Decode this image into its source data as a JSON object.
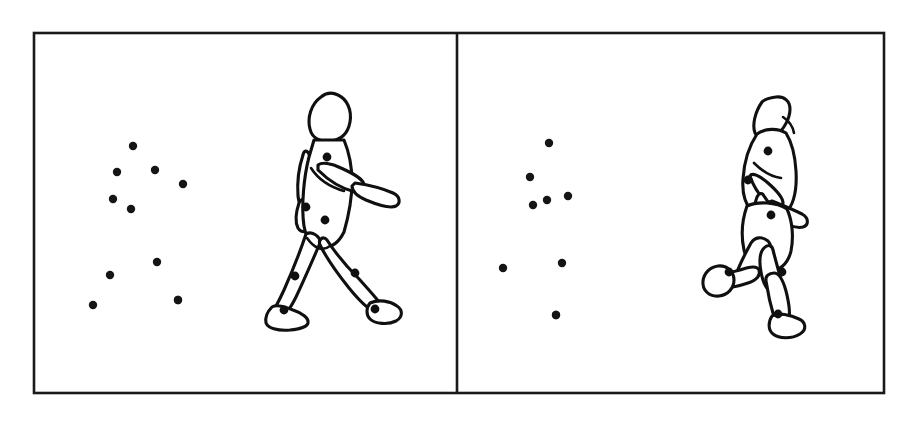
{
  "figure": {
    "background_color": "#ffffff",
    "ink_color": "#101010",
    "dot_color": "#151515",
    "border_color": "#1a1a1a",
    "border_width": 2.6,
    "outer_frame": {
      "x": 34,
      "y": 33,
      "width": 850,
      "height": 360
    },
    "divider_x": 457
  },
  "panels": [
    {
      "id": "panel-left",
      "label": "walking",
      "frame": {
        "x": 34,
        "y": 33,
        "width": 423,
        "height": 360
      },
      "point_light_display": {
        "label": "point-light walker",
        "dot_radius": 4.2,
        "count": 11,
        "dots": [
          {
            "name": "dot-head",
            "x": 133,
            "y": 146
          },
          {
            "name": "dot-shoulder-left",
            "x": 117,
            "y": 172
          },
          {
            "name": "dot-shoulder-right",
            "x": 155,
            "y": 170
          },
          {
            "name": "dot-elbow-right",
            "x": 183,
            "y": 184
          },
          {
            "name": "dot-elbow-left",
            "x": 113,
            "y": 199
          },
          {
            "name": "dot-wrist-left",
            "x": 131,
            "y": 209
          },
          {
            "name": "dot-hip-right",
            "x": 157,
            "y": 262
          },
          {
            "name": "dot-hip-left",
            "x": 110,
            "y": 275
          },
          {
            "name": "dot-knee-right",
            "x": 178,
            "y": 300
          },
          {
            "name": "dot-knee-left",
            "x": 93,
            "y": 305
          },
          {
            "name": "dot-ankle",
            "x": 178,
            "y": 300
          }
        ]
      },
      "body_figure": {
        "label": "walking figure",
        "pose": "mid-stride walk, facing right, right arm extended forward",
        "joint_markers": [
          {
            "name": "joint-shoulder",
            "x": 327,
            "y": 157,
            "r": 4.4
          },
          {
            "name": "joint-elbow",
            "x": 306,
            "y": 207,
            "r": 4.4
          },
          {
            "name": "joint-hip",
            "x": 325,
            "y": 220,
            "r": 4.4
          },
          {
            "name": "joint-knee-back",
            "x": 295,
            "y": 276,
            "r": 4.4
          },
          {
            "name": "joint-knee-front",
            "x": 355,
            "y": 273,
            "r": 4.4
          },
          {
            "name": "joint-ankle-back",
            "x": 284,
            "y": 310,
            "r": 4.4
          },
          {
            "name": "joint-ankle-front",
            "x": 375,
            "y": 309,
            "r": 4.4
          }
        ]
      }
    },
    {
      "id": "panel-right",
      "label": "running",
      "frame": {
        "x": 457,
        "y": 33,
        "width": 427,
        "height": 360
      },
      "point_light_display": {
        "label": "point-light runner",
        "dot_radius": 4.2,
        "count": 9,
        "dots": [
          {
            "name": "dot-head",
            "x": 549,
            "y": 143
          },
          {
            "name": "dot-shoulder",
            "x": 530,
            "y": 177
          },
          {
            "name": "dot-elbow",
            "x": 533,
            "y": 205
          },
          {
            "name": "dot-wrist",
            "x": 547,
            "y": 200
          },
          {
            "name": "dot-hip",
            "x": 568,
            "y": 196
          },
          {
            "name": "dot-knee-raised",
            "x": 562,
            "y": 263
          },
          {
            "name": "dot-ankle-support",
            "x": 503,
            "y": 268
          },
          {
            "name": "dot-foot-raised",
            "x": 556,
            "y": 315
          },
          {
            "name": "dot-toe",
            "x": 556,
            "y": 315
          }
        ]
      },
      "body_figure": {
        "label": "running figure",
        "pose": "knee raised, leaning forward, facing right",
        "joint_markers": [
          {
            "name": "joint-shoulder",
            "x": 768,
            "y": 151,
            "r": 4.4
          },
          {
            "name": "joint-elbow",
            "x": 748,
            "y": 180,
            "r": 4.4
          },
          {
            "name": "joint-hip",
            "x": 771,
            "y": 215,
            "r": 4.4
          },
          {
            "name": "joint-knee",
            "x": 782,
            "y": 272,
            "r": 4.4
          },
          {
            "name": "joint-ankle",
            "x": 729,
            "y": 272,
            "r": 4.4
          },
          {
            "name": "joint-foot",
            "x": 778,
            "y": 314,
            "r": 4.4
          }
        ]
      }
    }
  ]
}
